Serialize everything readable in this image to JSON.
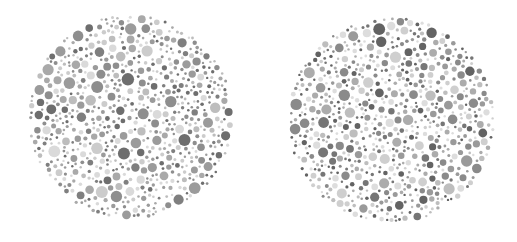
{
  "image": {
    "width": 517,
    "height": 242,
    "background": "#ffffff",
    "description": "Two grayscale Ishihara-style dot plates side by side"
  },
  "plates": [
    {
      "name": "plate-left",
      "cx": 131,
      "cy": 117,
      "r": 103,
      "seed": 17,
      "palette": [
        "#6e6e6e",
        "#7f7f7f",
        "#8e8e8e",
        "#9b9b9b",
        "#a9a9a9",
        "#bdbdbd",
        "#cccccc",
        "#dadada"
      ]
    },
    {
      "name": "plate-right",
      "cx": 391,
      "cy": 120,
      "r": 104,
      "seed": 53,
      "palette": [
        "#636363",
        "#767676",
        "#8a8a8a",
        "#9a9a9a",
        "#acacac",
        "#bebebe",
        "#cfcfcf",
        "#dddddd"
      ]
    }
  ]
}
